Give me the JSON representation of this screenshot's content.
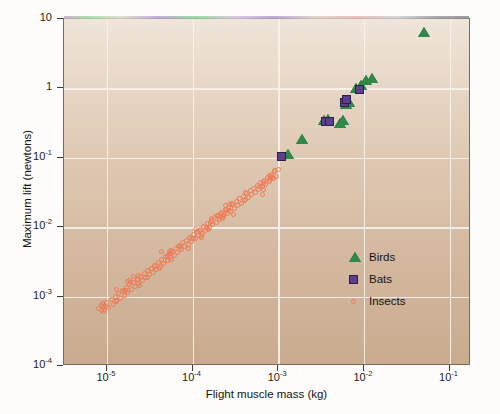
{
  "chart_data": {
    "type": "scatter",
    "title": "",
    "xlabel": "Flight muscle mass (kg)",
    "ylabel": "Maximum lift (newtons)",
    "xscale": "log",
    "yscale": "log",
    "xlim": [
      3.16e-06,
      0.178
    ],
    "ylim": [
      0.0001,
      10
    ],
    "grid": true,
    "legend_position": "inside-lower-right",
    "xticks": [
      {
        "value": 1e-05,
        "label_base": "10",
        "label_exp": "-5"
      },
      {
        "value": 0.0001,
        "label_base": "10",
        "label_exp": "-4"
      },
      {
        "value": 0.001,
        "label_base": "10",
        "label_exp": "-3"
      },
      {
        "value": 0.01,
        "label_base": "10",
        "label_exp": "-2"
      },
      {
        "value": 0.1,
        "label_base": "10",
        "label_exp": "-1"
      }
    ],
    "yticks": [
      {
        "value": 10,
        "label_base": "10",
        "label_exp": ""
      },
      {
        "value": 1,
        "label_base": "1",
        "label_exp": ""
      },
      {
        "value": 0.1,
        "label_base": "10",
        "label_exp": "-1"
      },
      {
        "value": 0.01,
        "label_base": "10",
        "label_exp": "-2"
      },
      {
        "value": 0.001,
        "label_base": "10",
        "label_exp": "-3"
      },
      {
        "value": 0.0001,
        "label_base": "10",
        "label_exp": "-4"
      }
    ],
    "series": [
      {
        "name": "Birds",
        "marker": "triangle",
        "color": "#2f8a4a",
        "points": [
          [
            0.0013,
            0.105
          ],
          [
            0.0019,
            0.175
          ],
          [
            0.0034,
            0.33
          ],
          [
            0.0038,
            0.34
          ],
          [
            0.0053,
            0.3
          ],
          [
            0.0057,
            0.33
          ],
          [
            0.0062,
            0.55
          ],
          [
            0.0067,
            0.6
          ],
          [
            0.008,
            0.95
          ],
          [
            0.0093,
            1.05
          ],
          [
            0.0105,
            1.25
          ],
          [
            0.0125,
            1.3
          ],
          [
            0.05,
            6.0
          ]
        ]
      },
      {
        "name": "Bats",
        "marker": "square",
        "color": "#5e3f8e",
        "points": [
          [
            0.0011,
            0.105
          ],
          [
            0.0036,
            0.33
          ],
          [
            0.004,
            0.33
          ],
          [
            0.0059,
            0.62
          ],
          [
            0.0063,
            0.7
          ],
          [
            0.0088,
            0.95
          ]
        ]
      },
      {
        "name": "Insects",
        "marker": "open-circle",
        "color": "#ef7a55",
        "n_points": 168,
        "points": [
          [
            8e-06,
            0.00068
          ],
          [
            8.6e-06,
            0.00074
          ],
          [
            9.2e-06,
            0.00062
          ],
          [
            1e-05,
            0.00082
          ],
          [
            1.05e-05,
            0.0007
          ],
          [
            1.12e-05,
            0.0009
          ],
          [
            1.18e-05,
            0.00078
          ],
          [
            1.25e-05,
            0.001
          ],
          [
            1.3e-05,
            0.00086
          ],
          [
            1.38e-05,
            0.0011
          ],
          [
            1.45e-05,
            0.00094
          ],
          [
            1.52e-05,
            0.00122
          ],
          [
            1.6e-05,
            0.00105
          ],
          [
            1.68e-05,
            0.00135
          ],
          [
            1.76e-05,
            0.00115
          ],
          [
            1.85e-05,
            0.00148
          ],
          [
            1.95e-05,
            0.00128
          ],
          [
            2.05e-05,
            0.00162
          ],
          [
            2.15e-05,
            0.0014
          ],
          [
            2.25e-05,
            0.00178
          ],
          [
            2.36e-05,
            0.00155
          ],
          [
            2.48e-05,
            0.00195
          ],
          [
            2.6e-05,
            0.0017
          ],
          [
            2.72e-05,
            0.00215
          ],
          [
            2.86e-05,
            0.00188
          ],
          [
            3e-05,
            0.00235
          ],
          [
            3.15e-05,
            0.00205
          ],
          [
            3.3e-05,
            0.00258
          ],
          [
            3.46e-05,
            0.00225
          ],
          [
            3.63e-05,
            0.00285
          ],
          [
            3.8e-05,
            0.00248
          ],
          [
            4e-05,
            0.0031
          ],
          [
            4.18e-05,
            0.00272
          ],
          [
            4.38e-05,
            0.00342
          ],
          [
            4.6e-05,
            0.003
          ],
          [
            4.82e-05,
            0.00375
          ],
          [
            5.05e-05,
            0.00328
          ],
          [
            5.3e-05,
            0.0041
          ],
          [
            5.55e-05,
            0.0036
          ],
          [
            5.82e-05,
            0.0045
          ],
          [
            6.1e-05,
            0.00395
          ],
          [
            6.4e-05,
            0.00495
          ],
          [
            6.7e-05,
            0.00432
          ],
          [
            7.02e-05,
            0.00542
          ],
          [
            7.36e-05,
            0.00475
          ],
          [
            7.72e-05,
            0.00595
          ],
          [
            8.1e-05,
            0.0052
          ],
          [
            8.48e-05,
            0.00652
          ],
          [
            8.9e-05,
            0.0057
          ],
          [
            9.32e-05,
            0.00715
          ],
          [
            9.78e-05,
            0.00625
          ],
          [
            0.000102,
            0.00785
          ],
          [
            0.000107,
            0.00685
          ],
          [
            0.000113,
            0.0086
          ],
          [
            0.000118,
            0.0075
          ],
          [
            0.000124,
            0.00942
          ],
          [
            0.00013,
            0.00822
          ],
          [
            0.000136,
            0.0103
          ],
          [
            0.000143,
            0.009
          ],
          [
            0.00015,
            0.0113
          ],
          [
            0.000157,
            0.00985
          ],
          [
            0.000165,
            0.0124
          ],
          [
            0.000173,
            0.0108
          ],
          [
            0.000181,
            0.0136
          ],
          [
            0.00019,
            0.0118
          ],
          [
            0.0002,
            0.0148
          ],
          [
            0.000209,
            0.013
          ],
          [
            0.00022,
            0.0163
          ],
          [
            0.00023,
            0.0142
          ],
          [
            0.000242,
            0.0178
          ],
          [
            0.000253,
            0.0155
          ],
          [
            0.000266,
            0.0195
          ],
          [
            0.000279,
            0.017
          ],
          [
            0.000292,
            0.0213
          ],
          [
            0.000307,
            0.0186
          ],
          [
            0.000322,
            0.0233
          ],
          [
            0.000337,
            0.0204
          ],
          [
            0.000354,
            0.0256
          ],
          [
            0.000371,
            0.0223
          ],
          [
            0.000389,
            0.028
          ],
          [
            0.000408,
            0.0244
          ],
          [
            0.000428,
            0.0306
          ],
          [
            0.000449,
            0.0267
          ],
          [
            0.00047,
            0.0335
          ],
          [
            0.000493,
            0.0292
          ],
          [
            0.000517,
            0.0366
          ],
          [
            0.000542,
            0.032
          ],
          [
            0.000568,
            0.04
          ],
          [
            0.000596,
            0.035
          ],
          [
            0.000625,
            0.0438
          ],
          [
            0.000655,
            0.0382
          ],
          [
            0.000687,
            0.0478
          ],
          [
            0.00072,
            0.0418
          ],
          [
            0.000755,
            0.0523
          ],
          [
            0.000792,
            0.0457
          ],
          [
            0.00083,
            0.0572
          ],
          [
            0.00087,
            0.05
          ],
          [
            0.000912,
            0.0625
          ],
          [
            0.000956,
            0.0546
          ],
          [
            0.001,
            0.0683
          ]
        ]
      }
    ]
  },
  "legend": {
    "items": [
      {
        "label": "Birds",
        "marker": "triangle",
        "color": "#2f8a4a"
      },
      {
        "label": "Bats",
        "marker": "square",
        "color": "#5e3f8e"
      },
      {
        "label": "Insects",
        "marker": "open-circle",
        "color": "#ef7a55"
      }
    ]
  }
}
